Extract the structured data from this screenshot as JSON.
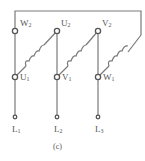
{
  "diagram": {
    "caption": "(c)",
    "type": "three-phase winding delta connection",
    "line_color": "#777777",
    "terminals_top": [
      {
        "letter": "W",
        "sub": "2"
      },
      {
        "letter": "U",
        "sub": "2"
      },
      {
        "letter": "V",
        "sub": "2"
      }
    ],
    "terminals_mid": [
      {
        "letter": "U",
        "sub": "1"
      },
      {
        "letter": "V",
        "sub": "1"
      },
      {
        "letter": "W",
        "sub": "1"
      }
    ],
    "lines": [
      {
        "letter": "L",
        "sub": "1"
      },
      {
        "letter": "L",
        "sub": "2"
      },
      {
        "letter": "L",
        "sub": "3"
      }
    ]
  }
}
